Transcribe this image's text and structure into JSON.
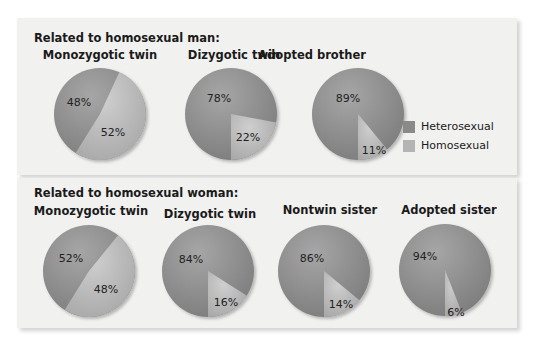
{
  "colors": {
    "heterosexual": "#8c8c8c",
    "homosexual": "#b8b8b8",
    "panel": "#f1f1f0"
  },
  "legend": {
    "items": [
      {
        "label": "Heterosexual",
        "color": "#8c8c8c"
      },
      {
        "label": "Homosexual",
        "color": "#b8b8b8"
      }
    ]
  },
  "man": {
    "title": "Related to homosexual man:",
    "charts": [
      {
        "label": "Monozygotic twin",
        "heterosexual": "48%",
        "homosexual": "52%"
      },
      {
        "label": "Dizygotic twin",
        "heterosexual": "78%",
        "homosexual": "22%"
      },
      {
        "label": "Adopted brother",
        "heterosexual": "89%",
        "homosexual": "11%"
      }
    ]
  },
  "woman": {
    "title": "Related to homosexual woman:",
    "charts": [
      {
        "label": "Monozygotic twin",
        "heterosexual": "52%",
        "homosexual": "48%"
      },
      {
        "label": "Dizygotic twin",
        "heterosexual": "84%",
        "homosexual": "16%"
      },
      {
        "label": "Nontwin sister",
        "heterosexual": "86%",
        "homosexual": "14%"
      },
      {
        "label": "Adopted sister",
        "heterosexual": "94%",
        "homosexual": "6%"
      }
    ]
  },
  "chart_data": [
    {
      "type": "pie",
      "title": "Related to homosexual man: Monozygotic twin",
      "categories": [
        "Heterosexual",
        "Homosexual"
      ],
      "values": [
        48,
        52
      ]
    },
    {
      "type": "pie",
      "title": "Related to homosexual man: Dizygotic twin",
      "categories": [
        "Heterosexual",
        "Homosexual"
      ],
      "values": [
        78,
        22
      ]
    },
    {
      "type": "pie",
      "title": "Related to homosexual man: Adopted brother",
      "categories": [
        "Heterosexual",
        "Homosexual"
      ],
      "values": [
        89,
        11
      ]
    },
    {
      "type": "pie",
      "title": "Related to homosexual woman: Monozygotic twin",
      "categories": [
        "Heterosexual",
        "Homosexual"
      ],
      "values": [
        52,
        48
      ]
    },
    {
      "type": "pie",
      "title": "Related to homosexual woman: Dizygotic twin",
      "categories": [
        "Heterosexual",
        "Homosexual"
      ],
      "values": [
        84,
        16
      ]
    },
    {
      "type": "pie",
      "title": "Related to homosexual woman: Nontwin sister",
      "categories": [
        "Heterosexual",
        "Homosexual"
      ],
      "values": [
        86,
        14
      ]
    },
    {
      "type": "pie",
      "title": "Related to homosexual woman: Adopted sister",
      "categories": [
        "Heterosexual",
        "Homosexual"
      ],
      "values": [
        94,
        6
      ]
    }
  ]
}
